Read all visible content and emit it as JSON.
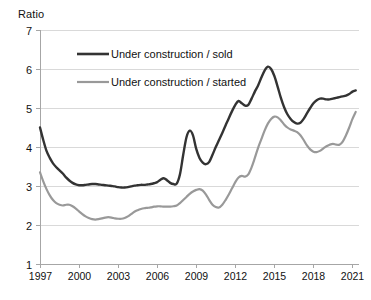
{
  "chart_data": {
    "type": "line",
    "title": "",
    "ylabel": "Ratio",
    "xlabel": "",
    "ylim": [
      1,
      7
    ],
    "xlim": [
      1997,
      2021.5
    ],
    "grid": true,
    "legend_position": "inside-top-left",
    "ytick_labels": [
      "7",
      "6",
      "5",
      "4",
      "3",
      "2",
      "1"
    ],
    "ytick_values": [
      7,
      6,
      5,
      4,
      3,
      2,
      1
    ],
    "xtick_labels": [
      "1997",
      "2000",
      "2003",
      "2006",
      "2009",
      "2012",
      "2015",
      "2018",
      "2021"
    ],
    "xtick_values": [
      1997,
      2000,
      2003,
      2006,
      2009,
      2012,
      2015,
      2018,
      2021
    ],
    "x": [
      1997.0,
      1997.25,
      1997.5,
      1997.75,
      1998.0,
      1998.25,
      1998.5,
      1998.75,
      1999.0,
      1999.25,
      1999.5,
      1999.75,
      2000.0,
      2000.25,
      2000.5,
      2000.75,
      2001.0,
      2001.25,
      2001.5,
      2001.75,
      2002.0,
      2002.25,
      2002.5,
      2002.75,
      2003.0,
      2003.25,
      2003.5,
      2003.75,
      2004.0,
      2004.25,
      2004.5,
      2004.75,
      2005.0,
      2005.25,
      2005.5,
      2005.75,
      2006.0,
      2006.25,
      2006.5,
      2006.75,
      2007.0,
      2007.25,
      2007.5,
      2007.75,
      2008.0,
      2008.25,
      2008.5,
      2008.75,
      2009.0,
      2009.25,
      2009.5,
      2009.75,
      2010.0,
      2010.25,
      2010.5,
      2010.75,
      2011.0,
      2011.25,
      2011.5,
      2011.75,
      2012.0,
      2012.25,
      2012.5,
      2012.75,
      2013.0,
      2013.25,
      2013.5,
      2013.75,
      2014.0,
      2014.25,
      2014.5,
      2014.75,
      2015.0,
      2015.25,
      2015.5,
      2015.75,
      2016.0,
      2016.25,
      2016.5,
      2016.75,
      2017.0,
      2017.25,
      2017.5,
      2017.75,
      2018.0,
      2018.25,
      2018.5,
      2018.75,
      2019.0,
      2019.25,
      2019.5,
      2019.75,
      2020.0,
      2020.25,
      2020.5,
      2020.75,
      2021.0,
      2021.25
    ],
    "series": [
      {
        "name": "Under construction / sold",
        "color": "#333333",
        "linewidth": 2.4,
        "values": [
          4.5,
          4.18,
          3.9,
          3.72,
          3.58,
          3.48,
          3.4,
          3.32,
          3.22,
          3.14,
          3.08,
          3.04,
          3.02,
          3.02,
          3.03,
          3.04,
          3.05,
          3.05,
          3.04,
          3.03,
          3.02,
          3.01,
          3.0,
          2.99,
          2.97,
          2.96,
          2.96,
          2.97,
          2.99,
          3.01,
          3.02,
          3.03,
          3.03,
          3.04,
          3.05,
          3.07,
          3.1,
          3.16,
          3.2,
          3.15,
          3.08,
          3.05,
          3.06,
          3.3,
          3.8,
          4.25,
          4.42,
          4.3,
          3.95,
          3.72,
          3.6,
          3.56,
          3.62,
          3.8,
          4.0,
          4.18,
          4.36,
          4.55,
          4.74,
          4.92,
          5.08,
          5.18,
          5.12,
          5.06,
          5.08,
          5.24,
          5.42,
          5.58,
          5.78,
          5.96,
          6.06,
          6.0,
          5.82,
          5.55,
          5.26,
          5.02,
          4.84,
          4.72,
          4.64,
          4.6,
          4.62,
          4.72,
          4.86,
          5.0,
          5.12,
          5.2,
          5.24,
          5.24,
          5.22,
          5.22,
          5.24,
          5.26,
          5.28,
          5.3,
          5.32,
          5.36,
          5.42,
          5.45
        ]
      },
      {
        "name": "Under construction / started",
        "color": "#999999",
        "linewidth": 2.2,
        "values": [
          3.35,
          3.12,
          2.92,
          2.76,
          2.64,
          2.56,
          2.52,
          2.5,
          2.52,
          2.52,
          2.48,
          2.42,
          2.35,
          2.28,
          2.22,
          2.18,
          2.15,
          2.14,
          2.15,
          2.17,
          2.19,
          2.2,
          2.19,
          2.17,
          2.16,
          2.16,
          2.18,
          2.22,
          2.28,
          2.34,
          2.38,
          2.41,
          2.43,
          2.44,
          2.45,
          2.47,
          2.48,
          2.48,
          2.47,
          2.47,
          2.47,
          2.48,
          2.5,
          2.56,
          2.64,
          2.72,
          2.8,
          2.86,
          2.9,
          2.92,
          2.88,
          2.78,
          2.64,
          2.52,
          2.46,
          2.45,
          2.52,
          2.64,
          2.78,
          2.94,
          3.1,
          3.22,
          3.26,
          3.24,
          3.3,
          3.48,
          3.72,
          3.98,
          4.2,
          4.42,
          4.6,
          4.72,
          4.78,
          4.76,
          4.68,
          4.58,
          4.5,
          4.45,
          4.42,
          4.38,
          4.3,
          4.18,
          4.04,
          3.94,
          3.88,
          3.87,
          3.9,
          3.96,
          4.02,
          4.06,
          4.08,
          4.06,
          4.06,
          4.14,
          4.3,
          4.5,
          4.72,
          4.9
        ]
      }
    ],
    "legend": [
      {
        "label": "Under construction / sold",
        "color": "#333333"
      },
      {
        "label": "Under construction / started",
        "color": "#999999"
      }
    ]
  }
}
